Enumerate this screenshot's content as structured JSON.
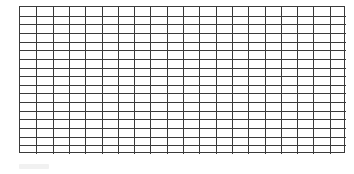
{
  "grid": {
    "columns": 20,
    "rows": 17,
    "line_color": "#3a3a3a",
    "background": "#ffffff"
  },
  "caption": {
    "text": ""
  }
}
